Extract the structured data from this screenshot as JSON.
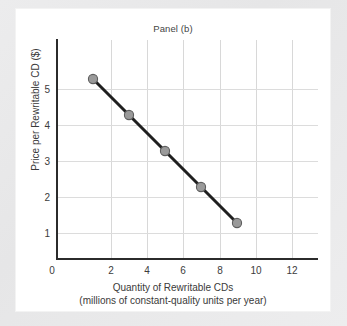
{
  "chart_data": {
    "type": "line",
    "title": "Panel (b)",
    "xlabel": "Quantity of Rewritable CDs",
    "xlabel_line2": "(millions of constant-quality units per year)",
    "ylabel": "Price per Rewritable CD ($)",
    "x": [
      2,
      4,
      6,
      8,
      10
    ],
    "values": [
      5,
      4,
      3,
      2,
      1
    ],
    "series": [
      {
        "name": "Demand",
        "x": [
          2,
          4,
          6,
          8,
          10
        ],
        "values": [
          5,
          4,
          3,
          2,
          1
        ]
      }
    ],
    "points": [
      {
        "x": 2,
        "y": 5
      },
      {
        "x": 4,
        "y": 4
      },
      {
        "x": 6,
        "y": 3
      },
      {
        "x": 8,
        "y": 2
      },
      {
        "x": 10,
        "y": 1
      }
    ],
    "xticks": [
      0,
      2,
      4,
      6,
      8,
      10,
      12
    ],
    "xtick_labels": [
      "0",
      "2",
      "4",
      "6",
      "8",
      "10",
      "12"
    ],
    "yticks": [
      1,
      2,
      3,
      4,
      5
    ],
    "ytick_labels": [
      "1",
      "2",
      "3",
      "4",
      "5"
    ],
    "xlim": [
      0,
      14
    ],
    "ylim": [
      0,
      6
    ],
    "grid": true,
    "legend": null,
    "line_color": "#1f1f1f",
    "marker_color": "#9a9a9a",
    "marker_edge_color": "#5e5e5e",
    "grid_color": "#d8d8d8",
    "axis_color": "#2b2b2b",
    "background_color": "#ffffff",
    "page_background_color": "#e9e9e9"
  }
}
